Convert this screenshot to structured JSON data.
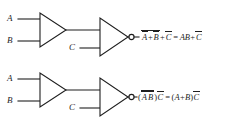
{
  "diagram": {
    "background_color": "#ffffff",
    "line_color": "#1f1f1f",
    "circuits": [
      {
        "id": "top",
        "name": "nand-or-equivalence",
        "inputs": [
          {
            "label": "A",
            "name": "input-a"
          },
          {
            "label": "B",
            "name": "input-b"
          },
          {
            "label": "C",
            "name": "input-c"
          }
        ],
        "gates": [
          {
            "name": "gate-1",
            "shape": "triangle",
            "bubble": false
          },
          {
            "name": "gate-2",
            "shape": "triangle",
            "bubble": true
          }
        ],
        "output_expression": {
          "lhs": {
            "terms": [
              "A",
              "+",
              "B"
            ],
            "overbar_group": "A+B",
            "plus": "+",
            "last_term": "C",
            "last_overbar": true
          },
          "equals": "=",
          "rhs": {
            "terms": [
              "A",
              "B"
            ],
            "plus": "+",
            "last_term": "C",
            "last_overbar": true
          },
          "plain_text": "A+B + C = AB + C"
        }
      },
      {
        "id": "bottom",
        "name": "nor-and-equivalence",
        "inputs": [
          {
            "label": "A",
            "name": "input-a"
          },
          {
            "label": "B",
            "name": "input-b"
          },
          {
            "label": "C",
            "name": "input-c"
          }
        ],
        "gates": [
          {
            "name": "gate-1",
            "shape": "triangle",
            "bubble": false
          },
          {
            "name": "gate-2",
            "shape": "triangle",
            "bubble": true
          }
        ],
        "output_expression": {
          "lhs": {
            "open_paren": "(",
            "terms": [
              "A",
              "B"
            ],
            "close_paren": ")",
            "last_term": "C",
            "last_overbar": true
          },
          "equals": "=",
          "rhs": {
            "open_paren": "(",
            "terms": [
              "A",
              "+",
              "B"
            ],
            "close_paren": ")",
            "last_term": "C",
            "last_overbar": true
          },
          "plain_text": "(AB)C = (A+B)C"
        }
      }
    ],
    "glyphs": {
      "plus": "+",
      "equals": "=",
      "open_paren": "(",
      "close_paren": ")",
      "letter_a": "A",
      "letter_b": "B",
      "letter_c": "C"
    }
  }
}
